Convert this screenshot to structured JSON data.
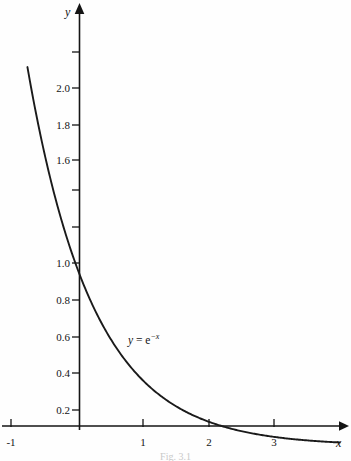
{
  "figure": {
    "caption": "Fig. 3.1",
    "curve_label_parts": {
      "lhs": "y",
      "equals": " = ",
      "base": "e",
      "exponent": "−x"
    },
    "axis_labels": {
      "x": "x",
      "y": "y"
    },
    "colors": {
      "ink": "#141414",
      "background": "#fefefe",
      "curve": "#1a1a1a"
    }
  },
  "chart_data": {
    "type": "line",
    "title": "",
    "subtitle": "",
    "xlabel": "x",
    "ylabel": "y",
    "annotations": [
      {
        "text": "y = e^-x",
        "x": 0.78,
        "y": 0.52
      }
    ],
    "legend": [],
    "legend_position": "none",
    "grid": false,
    "xlim": [
      -1.05,
      4.1
    ],
    "ylim": [
      0,
      2.35
    ],
    "xticks": [
      -1,
      1,
      2,
      3
    ],
    "xtick_labels": [
      "-1",
      "1",
      "2",
      "3"
    ],
    "xticks_all": [
      -1,
      0,
      1,
      2,
      3
    ],
    "yticks": [
      0.2,
      0.4,
      0.6,
      0.8,
      1.0,
      1.2,
      1.4,
      1.6,
      1.8,
      2.0,
      2.2
    ],
    "ytick_labels": [
      "0.2",
      "0.4",
      "0.6",
      "0.8",
      "1.0",
      "",
      "",
      "1.6",
      "1.8",
      "2.0",
      ""
    ],
    "series": [
      {
        "name": "y = e^-x",
        "formula": "exp(-x)",
        "x": [
          -0.75,
          -0.6,
          -0.45,
          -0.3,
          -0.15,
          0.0,
          0.25,
          0.5,
          0.75,
          1.0,
          1.25,
          1.5,
          1.75,
          2.0,
          2.25,
          2.5,
          2.75,
          3.0,
          3.25,
          3.5,
          3.75,
          4.0
        ],
        "values": [
          2.117,
          1.822,
          1.568,
          1.35,
          1.162,
          1.0,
          0.779,
          0.607,
          0.472,
          0.368,
          0.287,
          0.223,
          0.174,
          0.135,
          0.105,
          0.082,
          0.064,
          0.05,
          0.039,
          0.03,
          0.024,
          0.018
        ]
      }
    ]
  },
  "axis_ticks": {
    "y": [
      {
        "value": "2.0",
        "px": 88,
        "labeled": true
      },
      {
        "value": "1.8",
        "px": 125,
        "labeled": true
      },
      {
        "value": "1.6",
        "px": 160,
        "labeled": true
      },
      {
        "value": "1.0",
        "px": 263,
        "labeled": true
      },
      {
        "value": "0.8",
        "px": 300,
        "labeled": true
      },
      {
        "value": "0.6",
        "px": 337,
        "labeled": true
      },
      {
        "value": "0.4",
        "px": 373,
        "labeled": true
      },
      {
        "value": "0.2",
        "px": 410,
        "labeled": true
      }
    ],
    "x": [
      {
        "value": "-1",
        "px": 11
      },
      {
        "value": "1",
        "px": 143
      },
      {
        "value": "2",
        "px": 209
      },
      {
        "value": "3",
        "px": 274
      }
    ]
  }
}
